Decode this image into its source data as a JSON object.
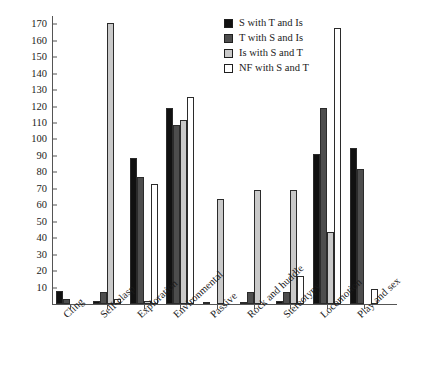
{
  "chart_data": {
    "type": "bar",
    "title": "",
    "xlabel": "",
    "ylabel": "",
    "ylim": [
      0,
      175
    ],
    "yticks": [
      10,
      20,
      30,
      40,
      50,
      60,
      70,
      80,
      90,
      100,
      110,
      120,
      130,
      140,
      150,
      160,
      170
    ],
    "grid": false,
    "legend_position": "top-right",
    "categories": [
      "Cling",
      "Self-clasp",
      "Exploration",
      "Environmental",
      "Passive",
      "Rock and huddle",
      "Stereotypy",
      "Locomotion",
      "Play and sex"
    ],
    "series": [
      {
        "name": "S with T and Is",
        "color": "#111111",
        "values": [
          8,
          2,
          89,
          119,
          1,
          1,
          2,
          91,
          95
        ]
      },
      {
        "name": "T with S and Is",
        "color": "#4d4d4d",
        "values": [
          3,
          7,
          77,
          109,
          0,
          7,
          7,
          119,
          82
        ]
      },
      {
        "name": "Is with S and T",
        "color": "#c9c9c9",
        "values": [
          0,
          171,
          2,
          112,
          64,
          69,
          69,
          44,
          0
        ]
      },
      {
        "name": "NF with S and T",
        "color": "#ffffff",
        "values": [
          0,
          3,
          73,
          126,
          0,
          0,
          17,
          168,
          9
        ]
      }
    ]
  },
  "legend": {
    "items": [
      {
        "label": "S with T and Is",
        "swatch": "black-swatch"
      },
      {
        "label": "T with S and Is",
        "swatch": "dark-gray-swatch"
      },
      {
        "label": "Is with S and T",
        "swatch": "light-gray-swatch"
      },
      {
        "label": "NF with S and T",
        "swatch": "white-swatch"
      }
    ]
  }
}
